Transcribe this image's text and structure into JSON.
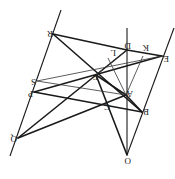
{
  "diagram": {
    "orientation": "rotated 180 degrees",
    "points": {
      "O": {
        "label": "O",
        "x": 127,
        "y": 155
      },
      "A": {
        "label": "A",
        "x": 126,
        "y": 95
      },
      "B": {
        "label": "B",
        "x": 142,
        "y": 112
      },
      "C": {
        "label": "C",
        "x": 108,
        "y": 104
      },
      "D": {
        "label": "D",
        "x": 127,
        "y": 50
      },
      "E": {
        "label": "E",
        "x": 162,
        "y": 56
      },
      "K": {
        "label": "K",
        "x": 143,
        "y": 52
      },
      "L": {
        "label": "L",
        "x": 113,
        "y": 56
      },
      "F": {
        "label": "F",
        "x": 96,
        "y": 75
      },
      "R": {
        "label": "R",
        "x": 53,
        "y": 34
      },
      "S": {
        "label": "S",
        "x": 37,
        "y": 81
      },
      "P": {
        "label": "P",
        "x": 34,
        "y": 92
      },
      "Q": {
        "label": "Q",
        "x": 18,
        "y": 138
      }
    },
    "labels": {
      "O": "O",
      "A": "A",
      "B": "B",
      "C": "C",
      "D": "D",
      "E": "E",
      "K": "K",
      "L": "L",
      "F": "F",
      "R": "R",
      "S": "S",
      "P": "P",
      "Q": "Q"
    },
    "colors": {
      "stroke": "#1a1a1a",
      "background": "#ffffff"
    }
  }
}
